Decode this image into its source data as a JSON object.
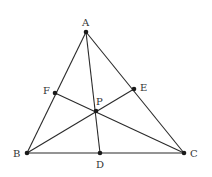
{
  "diagram": {
    "type": "triangle-cevians",
    "points": {
      "A": {
        "label": "A",
        "x": 86,
        "y": 32
      },
      "B": {
        "label": "B",
        "x": 27,
        "y": 153
      },
      "C": {
        "label": "C",
        "x": 184,
        "y": 153
      },
      "D": {
        "label": "D",
        "x": 100,
        "y": 153
      },
      "E": {
        "label": "E",
        "x": 134,
        "y": 89
      },
      "F": {
        "label": "F",
        "x": 55,
        "y": 93
      },
      "P": {
        "label": "P",
        "x": 96,
        "y": 111
      }
    },
    "segments": [
      [
        "A",
        "B"
      ],
      [
        "B",
        "C"
      ],
      [
        "C",
        "A"
      ],
      [
        "A",
        "D"
      ],
      [
        "B",
        "E"
      ],
      [
        "C",
        "F"
      ]
    ],
    "labels": {
      "A": "A",
      "B": "B",
      "C": "C",
      "D": "D",
      "E": "E",
      "F": "F",
      "P": "P"
    }
  }
}
